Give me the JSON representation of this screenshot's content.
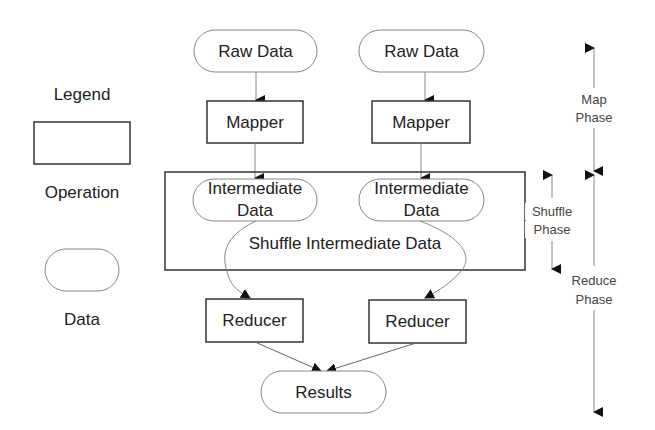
{
  "legend": {
    "title": "Legend",
    "operation_label": "Operation",
    "data_label": "Data"
  },
  "flow": {
    "raw_data_1": "Raw Data",
    "raw_data_2": "Raw Data",
    "mapper_1": "Mapper",
    "mapper_2": "Mapper",
    "intermediate_1": [
      "Intermediate",
      "Data"
    ],
    "intermediate_2": [
      "Intermediate",
      "Data"
    ],
    "shuffle_label": "Shuffle Intermediate Data",
    "reducer_1": "Reducer",
    "reducer_2": "Reducer",
    "results": "Results"
  },
  "phases": {
    "map": [
      "Map",
      "Phase"
    ],
    "shuffle": [
      "Shuffle",
      "Phase"
    ],
    "reduce": [
      "Reduce",
      "Phase"
    ]
  },
  "colors": {
    "stroke_dark": "#333333",
    "stroke_light": "#888888",
    "text": "#222222",
    "background": "#ffffff"
  }
}
